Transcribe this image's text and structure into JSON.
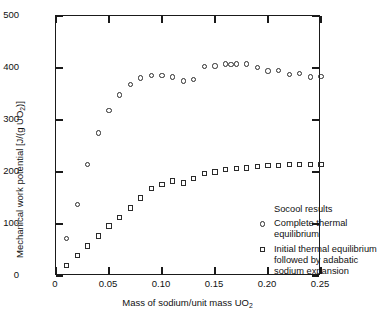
{
  "chart_data": {
    "type": "scatter",
    "title": "",
    "xlabel": "Mass of sodium/unit mass UO2",
    "ylabel": "Mechanical work potential [J/(g UO2)]",
    "xlim": [
      0,
      0.25
    ],
    "ylim": [
      0,
      500
    ],
    "grid": false,
    "legend_position": "inside-lower-right",
    "xticks": [
      0,
      0.05,
      0.1,
      0.15,
      0.2,
      0.25
    ],
    "xticklabels": [
      "0",
      "0.05",
      "0.10",
      "0.15",
      "0.20",
      "0.25"
    ],
    "yticks": [
      0,
      100,
      200,
      300,
      400,
      500
    ],
    "yticklabels": [
      "0",
      "100",
      "200",
      "300",
      "400",
      "500"
    ],
    "legend_title": "Socool results",
    "series": [
      {
        "name": "Complete thermal equilibrium",
        "marker": "open-circle",
        "x": [
          0.01,
          0.02,
          0.03,
          0.04,
          0.05,
          0.06,
          0.07,
          0.08,
          0.09,
          0.1,
          0.11,
          0.12,
          0.13,
          0.14,
          0.15,
          0.16,
          0.165,
          0.17,
          0.18,
          0.19,
          0.2,
          0.21,
          0.22,
          0.23,
          0.24,
          0.25
        ],
        "y": [
          72,
          138,
          215,
          275,
          318,
          348,
          368,
          381,
          386,
          386,
          383,
          375,
          378,
          403,
          404,
          408,
          407,
          408,
          408,
          401,
          394,
          395,
          388,
          390,
          383,
          384
        ]
      },
      {
        "name": "Initial thermal equilibrium followed by adabatic sodium expansion",
        "marker": "open-square",
        "x": [
          0.01,
          0.02,
          0.03,
          0.04,
          0.05,
          0.06,
          0.07,
          0.08,
          0.09,
          0.1,
          0.11,
          0.12,
          0.13,
          0.14,
          0.15,
          0.16,
          0.17,
          0.18,
          0.19,
          0.2,
          0.21,
          0.22,
          0.23,
          0.24,
          0.25
        ],
        "y": [
          20,
          40,
          58,
          77,
          96,
          112,
          131,
          150,
          168,
          176,
          183,
          179,
          187,
          197,
          200,
          205,
          207,
          208,
          211,
          212,
          212,
          214,
          215,
          214,
          215
        ]
      }
    ]
  },
  "axes": {
    "x_title_parts": {
      "before": "Mass of sodium/unit mass UO",
      "sub": "2",
      "after": ""
    },
    "y_title_parts": {
      "before": "Mechanical work potential [J/(g UO",
      "sub": "2",
      "after": ")]"
    }
  },
  "legend": {
    "title": "Socool results",
    "entries": [
      {
        "marker": "open-circle",
        "label": "Complete thermal equilibrium"
      },
      {
        "marker": "open-square",
        "label": "Initial thermal equilibrium followed by adabatic sodium expansion"
      }
    ]
  },
  "style": {
    "axis_color": "#1a1a1a",
    "marker_color": "#2b2b2b",
    "background": "#ffffff"
  }
}
